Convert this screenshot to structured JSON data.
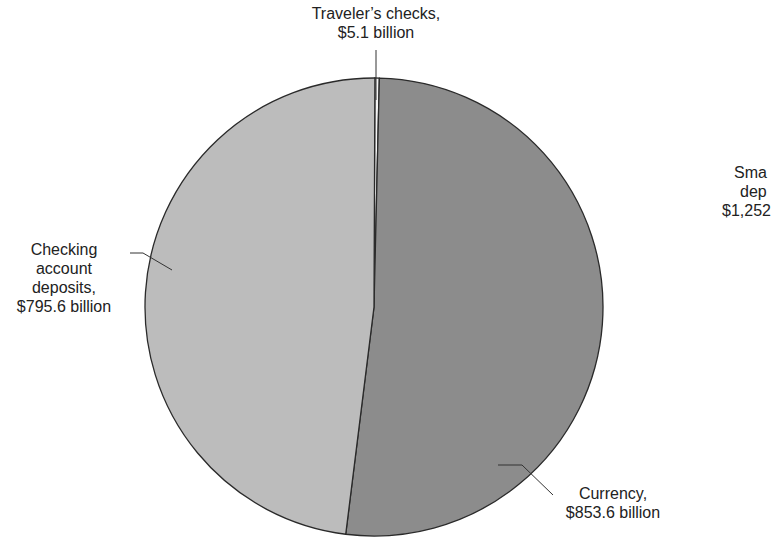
{
  "chart_data": {
    "type": "pie",
    "title": "",
    "slices": [
      {
        "label": "Traveler's checks",
        "value": 5.1,
        "unit": "billion",
        "display": "$5.1 billion",
        "color": "#f4f4f4"
      },
      {
        "label": "Currency",
        "value": 853.6,
        "unit": "billion",
        "display": "$853.6 billion",
        "color": "#8c8c8c"
      },
      {
        "label": "Checking account deposits",
        "value": 795.6,
        "unit": "billion",
        "display": "$795.6 billion",
        "color": "#bcbcbc"
      }
    ],
    "partial_label_right": {
      "line1": "Sma",
      "line2": "dep",
      "line3": "$1,252"
    }
  },
  "labels": {
    "travelers": {
      "line1": "Traveler’s checks,",
      "line2": "$5.1 billion"
    },
    "checking": {
      "line1": "Checking",
      "line2": "account",
      "line3": "deposits,",
      "line4": "$795.6 billion"
    },
    "currency": {
      "line1": "Currency,",
      "line2": "$853.6 billion"
    },
    "savings_partial": {
      "line1": "Sma",
      "line2": "dep",
      "line3": "$1,252"
    }
  }
}
